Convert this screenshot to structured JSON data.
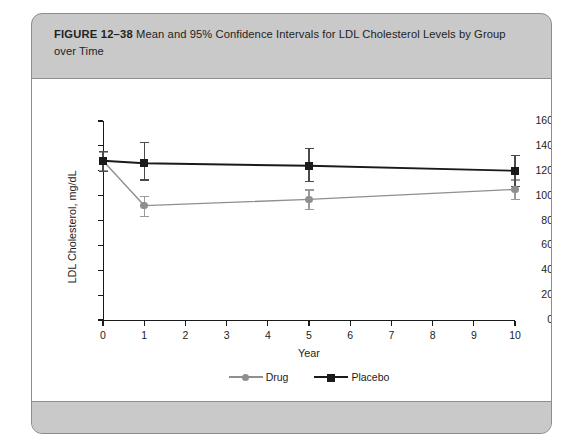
{
  "figure": {
    "label": "FIGURE 12–38",
    "caption": "Mean and 95% Confidence Intervals for LDL Cholesterol Levels by Group over Time"
  },
  "colors": {
    "panel_gray": "#c9c9c9",
    "panel_border": "#8d8d8d",
    "card_white": "#ffffff",
    "drug": "#8f8f8f",
    "placebo": "#1a1a1a",
    "axis": "#1a1a1a"
  },
  "chart_data": {
    "type": "line",
    "title": "",
    "xlabel": "Year",
    "ylabel": "LDL Cholesterol, mg/dL",
    "x": [
      0,
      1,
      5,
      10
    ],
    "xlim": [
      0,
      10
    ],
    "ylim": [
      0,
      160
    ],
    "xticks": [
      0,
      1,
      2,
      3,
      4,
      5,
      6,
      7,
      8,
      9,
      10
    ],
    "xticklabels": [
      "0",
      "1",
      "2",
      "3",
      "4",
      "5",
      "6",
      "7",
      "8",
      "9",
      "10"
    ],
    "yticks": [
      0,
      20,
      40,
      60,
      80,
      100,
      120,
      140,
      160
    ],
    "yticklabels": [
      "0",
      "20",
      "40",
      "60",
      "80",
      "100",
      "120",
      "140",
      "160"
    ],
    "grid": false,
    "legend_position": "below",
    "error_bars": "95% confidence interval",
    "series": [
      {
        "name": "Drug",
        "marker": "circle",
        "color": "#8f8f8f",
        "values": [
          128,
          92,
          97,
          105
        ],
        "ci_lower": [
          121,
          84,
          89,
          97
        ],
        "ci_upper": [
          135,
          100,
          105,
          113
        ]
      },
      {
        "name": "Placebo",
        "marker": "square",
        "color": "#1a1a1a",
        "values": [
          128,
          126,
          124,
          120
        ],
        "ci_lower": [
          120,
          113,
          112,
          108
        ],
        "ci_upper": [
          136,
          143,
          138,
          133
        ]
      }
    ]
  },
  "legend": {
    "items": [
      {
        "label": "Drug"
      },
      {
        "label": "Placebo"
      }
    ]
  }
}
